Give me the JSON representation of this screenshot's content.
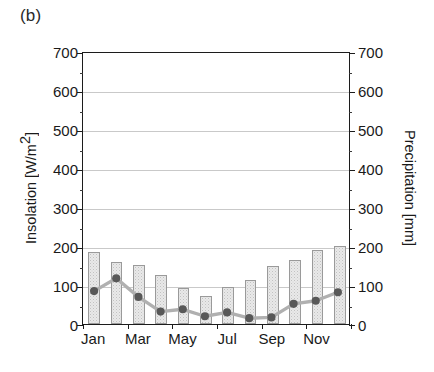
{
  "figure": {
    "panel_label": "(b)"
  },
  "axes": {
    "y_left_title_main": "Insolation [W/m",
    "y_left_title_sup": "2",
    "y_left_title_end": "]",
    "y_left_title_full": "Insolation [W/m2]",
    "y_right_title": "Precipitation [mm]",
    "y_ticks": [
      "0",
      "100",
      "200",
      "300",
      "400",
      "500",
      "600",
      "700"
    ],
    "x_tick_labels": [
      "Jan",
      "Mar",
      "May",
      "Jul",
      "Sep",
      "Nov"
    ]
  },
  "chart_data": {
    "type": "bar",
    "title": "(b)",
    "xlabel": "",
    "ylabel": "Insolation [W/m2]",
    "y2label": "Precipitation [mm]",
    "ylim": [
      0,
      700
    ],
    "y2lim": [
      0,
      700
    ],
    "ytick_step": 100,
    "grid": true,
    "legend": "none",
    "categories": [
      "Jan",
      "Feb",
      "Mar",
      "Apr",
      "May",
      "Jun",
      "Jul",
      "Aug",
      "Sep",
      "Oct",
      "Nov",
      "Dec"
    ],
    "x_labeled_categories": [
      "Jan",
      "Mar",
      "May",
      "Jul",
      "Sep",
      "Nov"
    ],
    "series": [
      {
        "name": "Insolation",
        "type": "bar",
        "axis": "left",
        "unit": "W/m2",
        "color": "#e9e9e9",
        "edge_color": "#9a9a9a",
        "values": [
          185,
          160,
          152,
          125,
          93,
          73,
          95,
          112,
          148,
          165,
          190,
          200
        ]
      },
      {
        "name": "Precipitation",
        "type": "line",
        "axis": "right",
        "unit": "mm",
        "color": "#b0b0b0",
        "marker_color": "#585858",
        "values": [
          85,
          118,
          70,
          32,
          38,
          20,
          30,
          15,
          17,
          52,
          60,
          82
        ]
      }
    ]
  }
}
